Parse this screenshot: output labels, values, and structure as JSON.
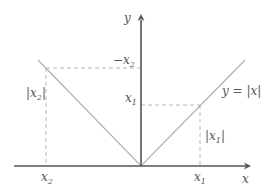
{
  "diagram": {
    "colors": {
      "axis": "#555555",
      "graph": "#b0b0b0",
      "dashed": "#b8b8b8",
      "text": "#555555"
    },
    "axes": {
      "x_label": "x",
      "y_label": "y"
    },
    "function_label": "y = |x|",
    "labels": {
      "neg_x2": {
        "prefix": "−x",
        "sub": "2"
      },
      "x1_y": {
        "prefix": "x",
        "sub": "1"
      },
      "abs_x2": {
        "prefix": "|x",
        "sub": "2",
        "suffix": "|"
      },
      "abs_x1": {
        "prefix": "|x",
        "sub": "1",
        "suffix": "|"
      },
      "x2_tick": {
        "prefix": "x",
        "sub": "2"
      },
      "x1_tick": {
        "prefix": "x",
        "sub": "1"
      }
    }
  }
}
